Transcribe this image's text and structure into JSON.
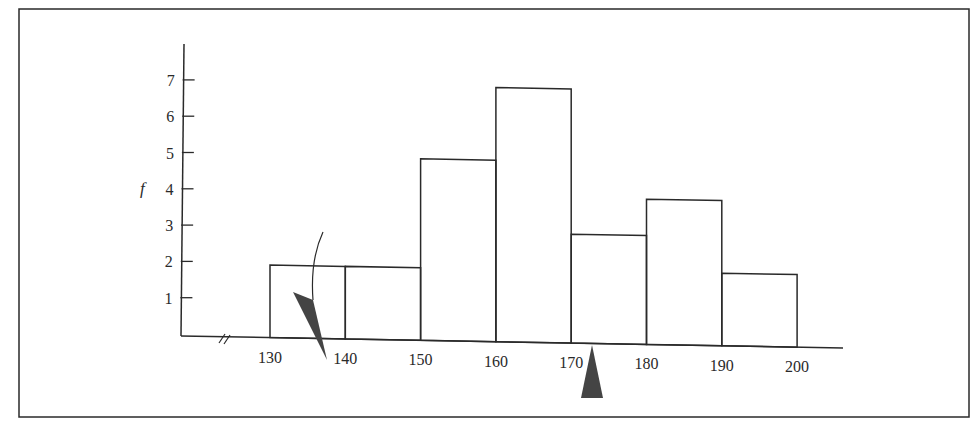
{
  "chart_data": {
    "type": "bar",
    "subtype": "histogram",
    "title": "",
    "xlabel": "",
    "ylabel": "f",
    "bins": [
      {
        "from": 130,
        "to": 140,
        "value": 2
      },
      {
        "from": 140,
        "to": 150,
        "value": 2
      },
      {
        "from": 150,
        "to": 160,
        "value": 5
      },
      {
        "from": 160,
        "to": 170,
        "value": 7
      },
      {
        "from": 170,
        "to": 180,
        "value": 3
      },
      {
        "from": 180,
        "to": 190,
        "value": 4
      },
      {
        "from": 190,
        "to": 200,
        "value": 2
      }
    ],
    "categories": [
      "130-140",
      "140-150",
      "150-160",
      "160-170",
      "170-180",
      "180-190",
      "190-200"
    ],
    "values": [
      2,
      2,
      5,
      7,
      3,
      4,
      2
    ],
    "x_ticks": [
      "130",
      "140",
      "150",
      "160",
      "170",
      "180",
      "190",
      "200"
    ],
    "y_ticks": [
      "1",
      "2",
      "3",
      "4",
      "5",
      "6",
      "7"
    ],
    "ylim": [
      0,
      8
    ],
    "xlim": [
      120,
      206
    ],
    "axis_break": "x-axis break symbol before 130",
    "grid": false,
    "legend": null,
    "annotations": [
      {
        "type": "curved-arrow",
        "description": "dark wedge pointer with curved stem pointing down at ~137 on x-axis"
      },
      {
        "type": "triangle-marker",
        "description": "dark upward triangle below x-axis at ~172"
      }
    ]
  },
  "colors": {
    "line": "#2a2a2a",
    "marker": "#444444",
    "background": "#ffffff"
  }
}
